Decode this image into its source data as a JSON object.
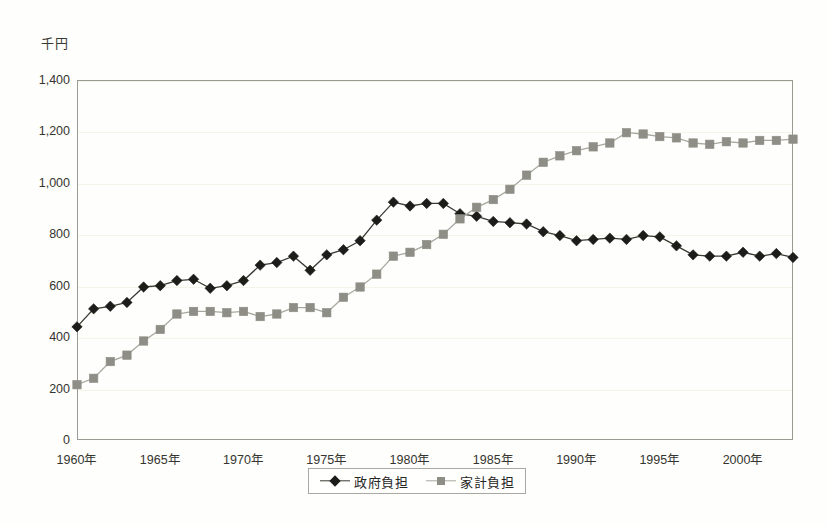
{
  "chart_data": {
    "type": "line",
    "title": "",
    "subtitle": "",
    "xlabel": "",
    "ylabel": "千円",
    "unit_label": "千円",
    "ylim": [
      0,
      1400
    ],
    "ytick_step": 200,
    "yticks": [
      "0",
      "200",
      "400",
      "600",
      "800",
      "1,000",
      "1,200",
      "1,400"
    ],
    "ytick_values": [
      0,
      200,
      400,
      600,
      800,
      1000,
      1200,
      1400
    ],
    "xlim": [
      1960,
      2003
    ],
    "xticks": [
      "1960年",
      "1965年",
      "1970年",
      "1975年",
      "1980年",
      "1985年",
      "1990年",
      "1995年",
      "2000年"
    ],
    "xtick_values": [
      1960,
      1965,
      1970,
      1975,
      1980,
      1985,
      1990,
      1995,
      2000
    ],
    "x": [
      1960,
      1961,
      1962,
      1963,
      1964,
      1965,
      1966,
      1967,
      1968,
      1969,
      1970,
      1971,
      1972,
      1973,
      1974,
      1975,
      1976,
      1977,
      1978,
      1979,
      1980,
      1981,
      1982,
      1983,
      1984,
      1985,
      1986,
      1987,
      1988,
      1989,
      1990,
      1991,
      1992,
      1993,
      1994,
      1995,
      1996,
      1997,
      1998,
      1999,
      2000,
      2001,
      2002,
      2003
    ],
    "grid": true,
    "grid_axis": "y",
    "legend_position": "bottom",
    "series": [
      {
        "name": "政府負担",
        "marker": "diamond",
        "color": "#1c1c18",
        "line_color": "#3a3a33",
        "values": [
          440,
          510,
          520,
          535,
          595,
          600,
          620,
          625,
          590,
          600,
          620,
          680,
          690,
          715,
          660,
          720,
          740,
          775,
          855,
          925,
          910,
          920,
          920,
          880,
          870,
          850,
          845,
          840,
          810,
          795,
          775,
          780,
          785,
          780,
          795,
          790,
          755,
          720,
          715,
          715,
          730,
          715,
          725,
          710
        ]
      },
      {
        "name": "家計負担",
        "marker": "square",
        "color": "#8e8e86",
        "line_color": "#a8a8a0",
        "values": [
          215,
          240,
          305,
          330,
          385,
          430,
          490,
          500,
          500,
          495,
          500,
          480,
          490,
          515,
          515,
          495,
          555,
          595,
          645,
          715,
          730,
          760,
          800,
          860,
          905,
          935,
          975,
          1030,
          1080,
          1105,
          1125,
          1140,
          1155,
          1195,
          1190,
          1180,
          1175,
          1155,
          1150,
          1160,
          1155,
          1165,
          1165,
          1170
        ]
      }
    ]
  },
  "legend": {
    "items": [
      {
        "label": "政府負担",
        "marker": "diamond"
      },
      {
        "label": "家計負担",
        "marker": "square"
      }
    ]
  }
}
